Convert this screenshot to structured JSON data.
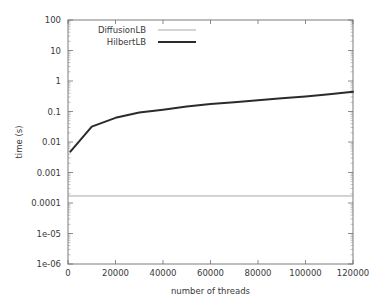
{
  "chart_data": {
    "type": "line",
    "title": "",
    "xlabel": "number of threads",
    "ylabel": "time (s)",
    "xscale": "linear",
    "yscale": "log",
    "xlim": [
      0,
      120000
    ],
    "ylim": [
      1e-06,
      100
    ],
    "grid": false,
    "legend_position": "top-left inside",
    "xticks": [
      0,
      20000,
      40000,
      60000,
      80000,
      100000,
      120000
    ],
    "xtick_labels": [
      "0",
      "20000",
      "40000",
      "60000",
      "80000",
      "100000",
      "120000"
    ],
    "yticks": [
      1e-06,
      1e-05,
      0.0001,
      0.001,
      0.01,
      0.1,
      1,
      10,
      100
    ],
    "ytick_labels": [
      "1e-06",
      "1e-05",
      "0.0001",
      "0.001",
      "0.01",
      "0.1",
      "1",
      "10",
      "100"
    ],
    "series": [
      {
        "name": "DiffusionLB",
        "color": "#a8a8a8",
        "width": 1.0,
        "x": [
          0,
          10000,
          20000,
          40000,
          60000,
          80000,
          100000,
          120000
        ],
        "values": [
          0.00017,
          0.00017,
          0.00017,
          0.00017,
          0.00017,
          0.00017,
          0.00017,
          0.00017
        ]
      },
      {
        "name": "HilbertLB",
        "color": "#2b2b2b",
        "width": 2.0,
        "x": [
          1000,
          10000,
          20000,
          30000,
          40000,
          50000,
          60000,
          70000,
          80000,
          90000,
          100000,
          110000,
          120000
        ],
        "values": [
          0.0048,
          0.032,
          0.062,
          0.092,
          0.115,
          0.145,
          0.175,
          0.2,
          0.235,
          0.27,
          0.31,
          0.37,
          0.44
        ]
      }
    ]
  },
  "legend": {
    "entries": [
      {
        "label": "DiffusionLB"
      },
      {
        "label": "HilbertLB"
      }
    ]
  },
  "axes": {
    "x_title": "number of threads",
    "y_title": "time (s)"
  }
}
